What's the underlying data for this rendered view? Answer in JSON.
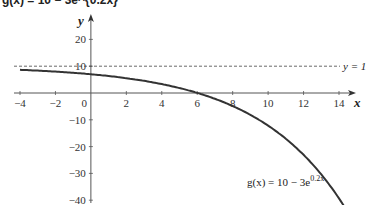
{
  "title": "g(x) = 10 − 3e^{0.2x}",
  "chart_data": {
    "type": "line",
    "title": "g(x) = 10 − 3e^{0.2x}",
    "xlabel": "x",
    "ylabel": "y",
    "xlim": [
      -4,
      14
    ],
    "ylim": [
      -40,
      20
    ],
    "x_ticks": [
      -4,
      -2,
      0,
      2,
      4,
      6,
      8,
      10,
      12,
      14
    ],
    "y_ticks": [
      -40,
      -30,
      -20,
      -10,
      10,
      20
    ],
    "grid": false,
    "series": [
      {
        "name": "g(x) = 10 − 3e^{0.2x}",
        "x": [
          -4,
          -2,
          0,
          2,
          4,
          6,
          8,
          10,
          12,
          14,
          14.5
        ],
        "values": [
          8.65,
          7.99,
          7.0,
          5.52,
          3.32,
          0.04,
          -4.86,
          -12.17,
          -23.07,
          -39.33,
          -44.05
        ]
      }
    ],
    "asymptote": {
      "y": 10,
      "label": "y = 1",
      "style": "dashed"
    },
    "annotations": [
      {
        "text": "g(x) = 10 − 3e",
        "superscript": "0.2x",
        "x": 9.5,
        "y": -33
      }
    ]
  },
  "labels": {
    "x_axis": "x",
    "y_axis": "y",
    "asymptote": "y = 1",
    "formula_main": "g(x) = 10 − 3e",
    "formula_sup": "0.2x",
    "x_ticks": [
      "−4",
      "−2",
      "0",
      "2",
      "4",
      "6",
      "8",
      "10",
      "12",
      "14"
    ],
    "y_ticks": [
      "20",
      "10",
      "−10",
      "−20",
      "−30",
      "−40"
    ]
  }
}
